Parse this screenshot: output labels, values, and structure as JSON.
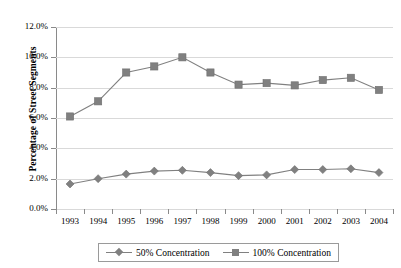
{
  "chart_data": {
    "type": "line",
    "title": "",
    "xlabel": "",
    "ylabel": "Percentage of Street Segments",
    "categories": [
      "1993",
      "1994",
      "1995",
      "1996",
      "1997",
      "1998",
      "1999",
      "2000",
      "2001",
      "2002",
      "2003",
      "2004"
    ],
    "ylim": [
      0,
      12
    ],
    "ytick_labels": [
      "0.0%",
      "2.0%",
      "4.0%",
      "6.0%",
      "8.0%",
      "10.0%",
      "12.0%"
    ],
    "ytick_values": [
      0,
      2,
      4,
      6,
      8,
      10,
      12
    ],
    "grid": true,
    "legend_position": "bottom",
    "series": [
      {
        "name": "50% Concentration",
        "marker": "diamond",
        "color": "#808080",
        "values": [
          1.65,
          2.0,
          2.3,
          2.5,
          2.55,
          2.4,
          2.2,
          2.25,
          2.6,
          2.6,
          2.65,
          2.4
        ]
      },
      {
        "name": "100% Concentration",
        "marker": "square",
        "color": "#808080",
        "values": [
          6.1,
          7.1,
          9.0,
          9.4,
          10.0,
          9.0,
          8.2,
          8.3,
          8.15,
          8.5,
          8.65,
          7.85
        ]
      }
    ]
  },
  "colors": {
    "series": "#808080",
    "gridline": "#d9d9d9",
    "axis": "#8a8a8a",
    "background": "#ffffff"
  }
}
